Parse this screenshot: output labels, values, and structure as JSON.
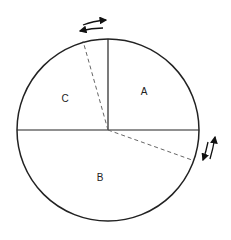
{
  "diagram": {
    "type": "circle-sector-diagram",
    "circle": {
      "cx": 108,
      "cy": 130,
      "r": 91
    },
    "stroke_color": "#222222",
    "dashed_color": "#666666",
    "regions": [
      {
        "id": "A",
        "label": "A",
        "x": 144,
        "y": 91
      },
      {
        "id": "B",
        "label": "B",
        "x": 100,
        "y": 177
      },
      {
        "id": "C",
        "label": "C",
        "x": 65,
        "y": 98
      }
    ],
    "solid_lines": [
      {
        "name": "vertical-radius",
        "x1": 108,
        "y1": 130,
        "x2": 108,
        "y2": 39
      },
      {
        "name": "horizontal-diameter",
        "x1": 17,
        "y1": 130,
        "x2": 199,
        "y2": 130
      }
    ],
    "dashed_lines": [
      {
        "name": "dashed-radius-upper",
        "x1": 108,
        "y1": 130,
        "x2": 83,
        "y2": 41
      },
      {
        "name": "dashed-radius-right",
        "x1": 108,
        "y1": 130,
        "x2": 192,
        "y2": 160
      }
    ],
    "arrows": [
      {
        "name": "top-arrow-right",
        "direction": "right"
      },
      {
        "name": "top-arrow-left",
        "direction": "left"
      },
      {
        "name": "side-arrow-down",
        "direction": "down"
      },
      {
        "name": "side-arrow-up",
        "direction": "up"
      }
    ]
  }
}
